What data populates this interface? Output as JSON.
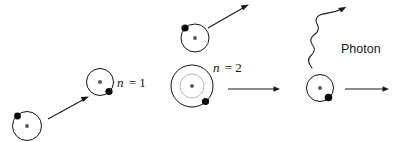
{
  "figure": {
    "width": 396,
    "height": 142,
    "background": "#ffffff",
    "stroke_color": "#111111",
    "electron_color": "#0a0a0a",
    "nucleus_color": "#5d5d5d",
    "inner_orbit_color": "#b9b9b9"
  },
  "labels": {
    "ground_state": "n = 1",
    "ground_state_symbol": "n",
    "ground_state_value": "= 1",
    "excited_state": "n = 2",
    "excited_state_symbol": "n",
    "excited_state_value": "= 2",
    "photon": "Photon"
  },
  "atoms": [
    {
      "id": "atom-incoming",
      "name": "incoming-atom",
      "cx": 27,
      "cy": 126,
      "radius": 14.5,
      "shells": 1,
      "electron": {
        "cx": 17.5,
        "cy": 116,
        "r": 3.4
      },
      "nucleus": {
        "cx": 27,
        "cy": 126,
        "r": 2.0
      }
    },
    {
      "id": "atom-ground",
      "name": "ground-state-atom",
      "cx": 100,
      "cy": 82,
      "radius": 13.5,
      "shells": 1,
      "electron": {
        "cx": 109,
        "cy": 91.5,
        "r": 3.6
      },
      "nucleus": {
        "cx": 100,
        "cy": 82,
        "r": 2.0
      }
    },
    {
      "id": "atom-deflected",
      "name": "deflected-atom",
      "cx": 195,
      "cy": 38,
      "radius": 14.0,
      "shells": 1,
      "electron": {
        "cx": 185,
        "cy": 28,
        "r": 3.6
      },
      "nucleus": {
        "cx": 195,
        "cy": 38,
        "r": 2.0
      }
    },
    {
      "id": "atom-excited",
      "name": "excited-state-atom",
      "cx": 192,
      "cy": 86,
      "radius": 21.0,
      "inner_radius": 12.0,
      "shells": 2,
      "electron": {
        "cx": 205.5,
        "cy": 101.5,
        "r": 3.6
      },
      "nucleus": {
        "cx": 192,
        "cy": 86,
        "r": 2.0
      }
    },
    {
      "id": "atom-relaxed",
      "name": "relaxed-atom",
      "cx": 320,
      "cy": 88,
      "radius": 13.5,
      "shells": 1,
      "electron": {
        "cx": 328.5,
        "cy": 97.5,
        "r": 3.8
      },
      "nucleus": {
        "cx": 320,
        "cy": 88,
        "r": 2.0
      }
    }
  ],
  "arrows": [
    {
      "id": "arrow-approach",
      "name": "approach-arrow",
      "x1": 48,
      "y1": 119,
      "x2": 88,
      "y2": 97
    },
    {
      "id": "arrow-scatter",
      "name": "scatter-arrow",
      "x1": 208,
      "y1": 28,
      "x2": 248,
      "y2": 5
    },
    {
      "id": "arrow-transit",
      "name": "transit-arrow",
      "x1": 228,
      "y1": 89,
      "x2": 279,
      "y2": 89
    },
    {
      "id": "arrow-exit",
      "name": "exit-arrow",
      "x1": 345,
      "y1": 89,
      "x2": 388,
      "y2": 89
    }
  ],
  "photon": {
    "id": "photon-wave",
    "name": "photon-wave",
    "start": {
      "x": 312,
      "y": 68
    },
    "tip": {
      "x": 346,
      "y": 7
    },
    "label_x": 341,
    "label_y": 53
  },
  "label_positions": {
    "ground_state": {
      "x": 117,
      "y": 87
    },
    "excited_state": {
      "x": 213,
      "y": 72
    }
  }
}
